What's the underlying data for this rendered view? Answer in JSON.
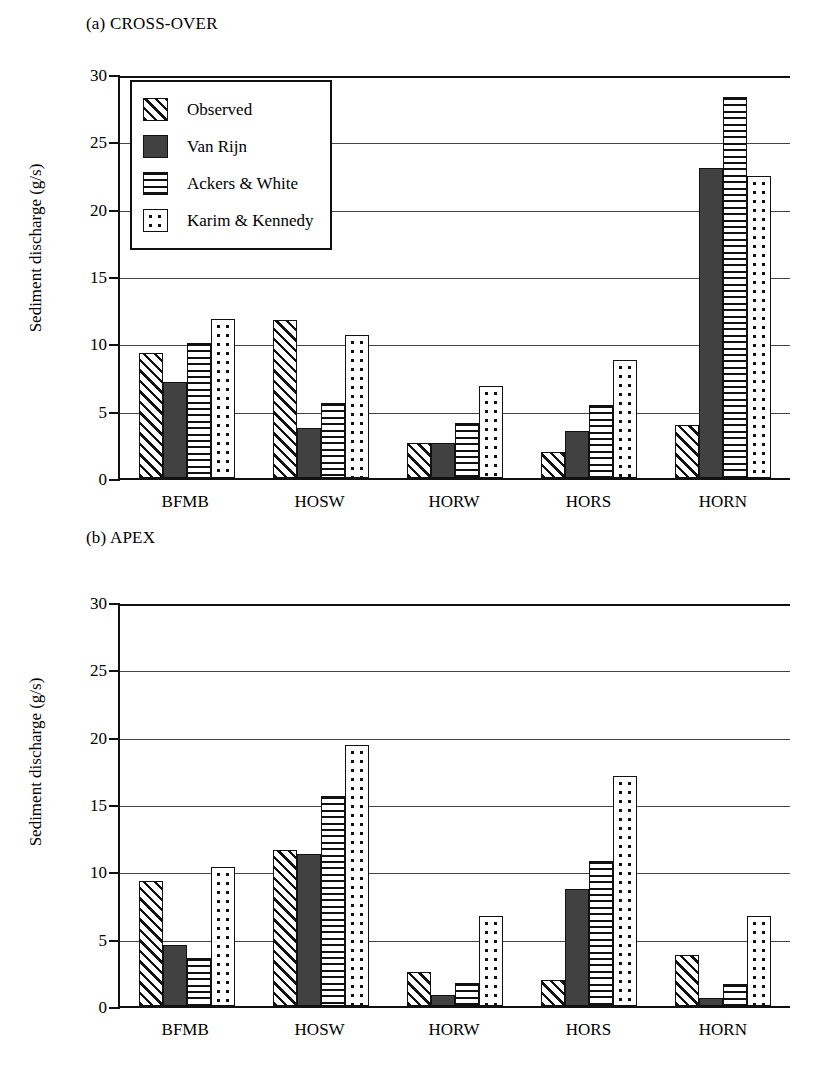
{
  "figure": {
    "ylabel": "Sediment discharge (g/s)",
    "yticks": [
      "30",
      "25",
      "20",
      "15",
      "10",
      "5",
      "0"
    ]
  },
  "legend": {
    "items": [
      {
        "label": "Observed",
        "pattern": "diagonal-hatch"
      },
      {
        "label": "Van Rijn",
        "pattern": "solid-dark"
      },
      {
        "label": "Ackers & White",
        "pattern": "horizontal-lines"
      },
      {
        "label": "Karim & Kennedy",
        "pattern": "dotted"
      }
    ]
  },
  "panels": [
    {
      "title": "(a) CROSS-OVER"
    },
    {
      "title": "(b) APEX"
    }
  ],
  "chart_data": [
    {
      "type": "bar",
      "title": "(a) CROSS-OVER",
      "xlabel": "",
      "ylabel": "Sediment discharge (g/s)",
      "ylim": [
        0,
        30
      ],
      "yticks": [
        0,
        5,
        10,
        15,
        20,
        25,
        30
      ],
      "grid": true,
      "legend_position": "upper-left-inside",
      "categories": [
        "BFMB",
        "HOSW",
        "HORW",
        "HORS",
        "HORN"
      ],
      "series": [
        {
          "name": "Observed",
          "values": [
            9.3,
            11.7,
            2.6,
            1.9,
            3.9
          ]
        },
        {
          "name": "Van Rijn",
          "values": [
            7.1,
            3.7,
            2.6,
            3.5,
            23.0
          ]
        },
        {
          "name": "Ackers & White",
          "values": [
            10.0,
            5.6,
            4.1,
            5.4,
            28.3
          ]
        },
        {
          "name": "Karim & Kennedy",
          "values": [
            11.8,
            10.6,
            6.8,
            8.8,
            22.4
          ]
        }
      ]
    },
    {
      "type": "bar",
      "title": "(b) APEX",
      "xlabel": "",
      "ylabel": "Sediment discharge (g/s)",
      "ylim": [
        0,
        30
      ],
      "yticks": [
        0,
        5,
        10,
        15,
        20,
        25,
        30
      ],
      "grid": true,
      "legend_position": "upper-right-inside",
      "categories": [
        "BFMB",
        "HOSW",
        "HORW",
        "HORS",
        "HORN"
      ],
      "series": [
        {
          "name": "Observed",
          "values": [
            9.3,
            11.6,
            2.5,
            1.9,
            3.8
          ]
        },
        {
          "name": "Van Rijn",
          "values": [
            4.5,
            11.3,
            0.8,
            8.7,
            0.6
          ]
        },
        {
          "name": "Ackers & White",
          "values": [
            3.6,
            15.6,
            1.7,
            10.8,
            1.6
          ]
        },
        {
          "name": "Karim & Kennedy",
          "values": [
            10.3,
            19.4,
            6.7,
            17.1,
            6.7
          ]
        }
      ]
    }
  ]
}
